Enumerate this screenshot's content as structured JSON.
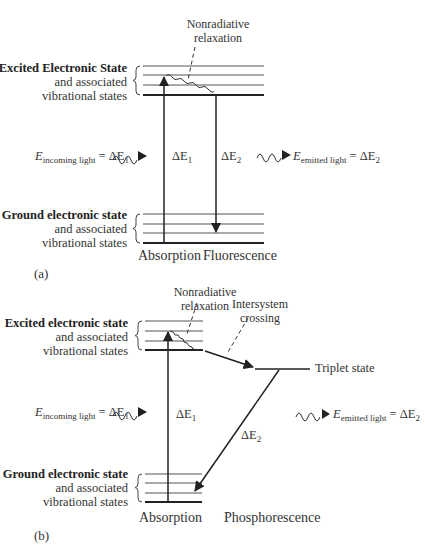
{
  "panel_a": {
    "label": "(a)",
    "excited_state": {
      "title": "Excited Electronic State",
      "line2": "and associated",
      "line3": "vibrational states"
    },
    "ground_state": {
      "title": "Ground electronic state",
      "line2": "and associated",
      "line3": "vibrational states"
    },
    "annotations": {
      "nonradiative_1": "Nonradiative",
      "nonradiative_2": "relaxation"
    },
    "incoming": {
      "E": "E",
      "sub": "incoming light",
      "eq": " = ΔE",
      "idx": "1"
    },
    "emitted": {
      "E": "E",
      "sub": "emitted light",
      "eq": " = ΔE",
      "idx": "2"
    },
    "delta_e1": {
      "d": "ΔE",
      "idx": "1"
    },
    "delta_e2": {
      "d": "ΔE",
      "idx": "2"
    },
    "process_left": "Absorption",
    "process_right": "Fluorescence"
  },
  "panel_b": {
    "label": "(b)",
    "excited_state": {
      "title": "Excited electronic state",
      "line2": "and associated",
      "line3": "vibrational states"
    },
    "ground_state": {
      "title": "Ground electronic state",
      "line2": "and associated",
      "line3": "vibrational states"
    },
    "annotations": {
      "nonradiative_1": "Nonradiative",
      "nonradiative_2": "relaxation",
      "isc_1": "Intersystem",
      "isc_2": "crossing",
      "triplet": "Triplet state"
    },
    "incoming": {
      "E": "E",
      "sub": "incoming light",
      "eq": " = ΔE",
      "idx": "1"
    },
    "emitted": {
      "E": "E",
      "sub": "emitted light",
      "eq": " = ΔE",
      "idx": "2"
    },
    "delta_e1": {
      "d": "ΔE",
      "idx": "1"
    },
    "delta_e2": {
      "d": "ΔE",
      "idx": "2"
    },
    "process_left": "Absorption",
    "process_right": "Phosphorescence"
  },
  "colors": {
    "line": "#333333",
    "thin_line": "#555555",
    "text": "#333333"
  }
}
